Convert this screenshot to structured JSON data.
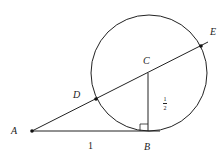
{
  "diagram": {
    "type": "geometry",
    "points": {
      "A": {
        "label": "A",
        "x": 32,
        "y": 131
      },
      "B": {
        "label": "B",
        "x": 148,
        "y": 131
      },
      "C": {
        "label": "C",
        "x": 148,
        "y": 73
      },
      "D": {
        "label": "D",
        "x": 96,
        "y": 99
      },
      "E": {
        "label": "E",
        "x": 201,
        "y": 46
      }
    },
    "circle": {
      "center": "C",
      "radius": 58
    },
    "segments": [
      "A-B",
      "C-B",
      "A-E (secant through D, C, E)"
    ],
    "right_angle_at": "B",
    "measurements": {
      "AB": "1",
      "CB_numerator": "1",
      "CB_denominator": "2"
    },
    "colors": {
      "stroke": "#222222",
      "background": "#ffffff"
    }
  }
}
